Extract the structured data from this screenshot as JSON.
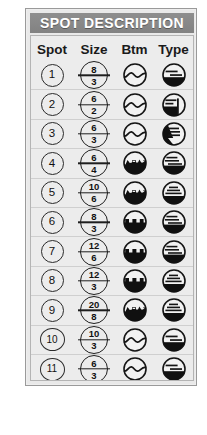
{
  "panel": {
    "title": "SPOT DESCRIPTION",
    "accent_header_color": "#8a8a8a",
    "background_color": "#e9e9e9",
    "border_color": "#9a9a9a",
    "text_color": "#1a1a1a"
  },
  "columns": [
    {
      "key": "spot",
      "label": "Spot"
    },
    {
      "key": "size",
      "label": "Size"
    },
    {
      "key": "btm",
      "label": "Btm"
    },
    {
      "key": "type",
      "label": "Type"
    }
  ],
  "rows": [
    {
      "spot": "1",
      "size_num": "8",
      "size_den": "3",
      "btm_icon": "wavy-open-bottom-icon",
      "type_icon": "type-halffill-twolines-icon"
    },
    {
      "spot": "2",
      "size_num": "6",
      "size_den": "2",
      "btm_icon": "wavy-open-bottom-icon",
      "type_icon": "type-vertical-edge-icon"
    },
    {
      "spot": "3",
      "size_num": "6",
      "size_den": "3",
      "btm_icon": "wavy-open-bottom-icon",
      "type_icon": "type-left-dark-wedge-icon"
    },
    {
      "spot": "4",
      "size_num": "6",
      "size_den": "4",
      "btm_icon": "rocky-filled-bottom-icon",
      "type_icon": "type-halffill-threelines-icon"
    },
    {
      "spot": "5",
      "size_num": "10",
      "size_den": "6",
      "btm_icon": "rocky-filled-bottom-icon",
      "type_icon": "type-halffill-stacked-icon"
    },
    {
      "spot": "6",
      "size_num": "8",
      "size_den": "3",
      "btm_icon": "castle-filled-bottom-icon",
      "type_icon": "type-halffill-threelines-icon"
    },
    {
      "spot": "7",
      "size_num": "12",
      "size_den": "6",
      "btm_icon": "castle-filled-bottom-icon",
      "type_icon": "type-halffill-threelines-icon"
    },
    {
      "spot": "8",
      "size_num": "12",
      "size_den": "3",
      "btm_icon": "castle-filled-bottom-icon",
      "type_icon": "type-halffill-stacked-icon"
    },
    {
      "spot": "9",
      "size_num": "20",
      "size_den": "8",
      "btm_icon": "rocky-filled-bottom-icon",
      "type_icon": "type-halffill-stacked-icon"
    },
    {
      "spot": "10",
      "size_num": "10",
      "size_den": "3",
      "btm_icon": "wavy-open-bottom-icon",
      "type_icon": "type-halffill-twolines-icon"
    },
    {
      "spot": "11",
      "size_num": "6",
      "size_den": "3",
      "btm_icon": "wavy-open-bottom-icon",
      "type_icon": "type-halffill-twolines-icon"
    }
  ]
}
